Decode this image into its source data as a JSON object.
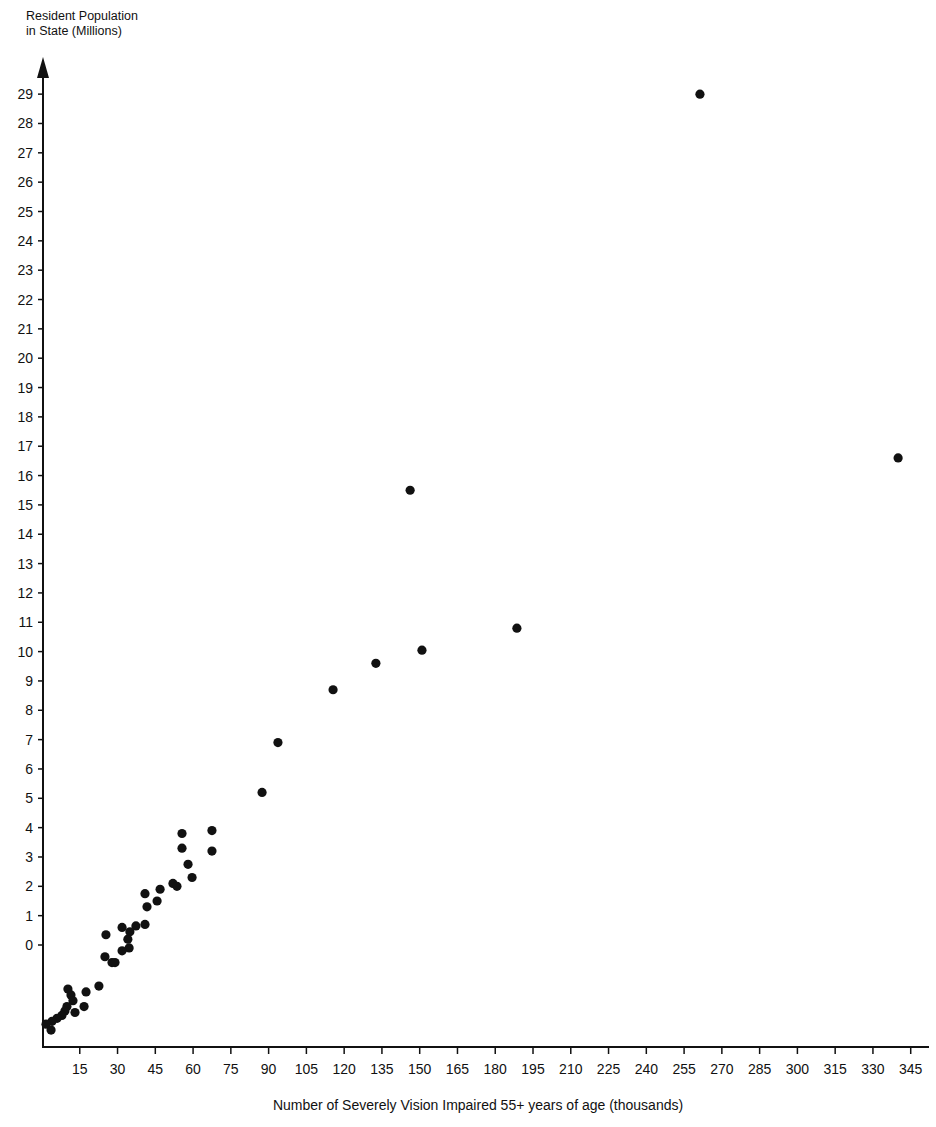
{
  "chart_data": {
    "type": "scatter",
    "title": "",
    "ylabel": "Resident Population in State (Millions)",
    "ylabel_lines": [
      "Resident Population",
      "in State (Millions)"
    ],
    "xlabel": "Number of Severely Vision Impaired 55+ years of age (thousands)",
    "x_ticks": [
      15,
      30,
      45,
      60,
      75,
      90,
      105,
      120,
      135,
      150,
      165,
      180,
      195,
      210,
      225,
      240,
      255,
      270,
      285,
      300,
      315,
      330,
      345
    ],
    "y_ticks": [
      0,
      1,
      2,
      3,
      4,
      5,
      6,
      7,
      8,
      9,
      10,
      11,
      12,
      13,
      14,
      15,
      16,
      17,
      18,
      19,
      20,
      21,
      22,
      23,
      24,
      25,
      26,
      27,
      28,
      29
    ],
    "xlim": [
      0,
      352
    ],
    "ylim": [
      -3.4,
      30.2
    ],
    "grid": false,
    "legend": null,
    "marker_color": "#111111",
    "points": [
      {
        "x": 261.3,
        "y": 29.0
      },
      {
        "x": 340.0,
        "y": 16.6
      },
      {
        "x": 146.2,
        "y": 15.5
      },
      {
        "x": 188.6,
        "y": 10.8
      },
      {
        "x": 150.9,
        "y": 10.05
      },
      {
        "x": 132.6,
        "y": 9.6
      },
      {
        "x": 115.6,
        "y": 8.7
      },
      {
        "x": 93.7,
        "y": 6.9
      },
      {
        "x": 87.4,
        "y": 5.2
      },
      {
        "x": 67.5,
        "y": 3.9
      },
      {
        "x": 55.6,
        "y": 3.8
      },
      {
        "x": 55.6,
        "y": 3.3
      },
      {
        "x": 67.5,
        "y": 3.2
      },
      {
        "x": 58.0,
        "y": 2.75
      },
      {
        "x": 59.6,
        "y": 2.3
      },
      {
        "x": 52.0,
        "y": 2.1
      },
      {
        "x": 53.6,
        "y": 2.0
      },
      {
        "x": 46.9,
        "y": 1.9
      },
      {
        "x": 40.9,
        "y": 1.75
      },
      {
        "x": 41.7,
        "y": 1.3
      },
      {
        "x": 45.7,
        "y": 1.5
      },
      {
        "x": 40.9,
        "y": 0.7
      },
      {
        "x": 37.3,
        "y": 0.65
      },
      {
        "x": 34.9,
        "y": 0.45
      },
      {
        "x": 34.1,
        "y": 0.2
      },
      {
        "x": 31.8,
        "y": 0.6
      },
      {
        "x": 25.4,
        "y": 0.35
      },
      {
        "x": 34.6,
        "y": -0.1
      },
      {
        "x": 31.8,
        "y": -0.2
      },
      {
        "x": 25.0,
        "y": -0.4
      },
      {
        "x": 27.8,
        "y": -0.6
      },
      {
        "x": 29.0,
        "y": -0.6
      },
      {
        "x": 22.6,
        "y": -1.4
      },
      {
        "x": 17.5,
        "y": -1.6
      },
      {
        "x": 16.7,
        "y": -2.1
      },
      {
        "x": 10.3,
        "y": -1.5
      },
      {
        "x": 11.5,
        "y": -1.7
      },
      {
        "x": 12.3,
        "y": -1.9
      },
      {
        "x": 9.9,
        "y": -2.1
      },
      {
        "x": 13.1,
        "y": -2.3
      },
      {
        "x": 9.1,
        "y": -2.25
      },
      {
        "x": 7.9,
        "y": -2.4
      },
      {
        "x": 6.0,
        "y": -2.5
      },
      {
        "x": 4.0,
        "y": -2.6
      },
      {
        "x": 1.6,
        "y": -2.7
      },
      {
        "x": 3.6,
        "y": -2.9
      }
    ]
  }
}
